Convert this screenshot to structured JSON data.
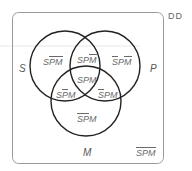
{
  "diagram": {
    "corner_label": "DD",
    "sets": {
      "S": "S",
      "P": "P",
      "M": "M"
    },
    "regions": [
      {
        "id": "s_only",
        "letters": [
          {
            "c": "S",
            "bar": false
          },
          {
            "c": "P",
            "bar": true
          },
          {
            "c": "M",
            "bar": true
          }
        ]
      },
      {
        "id": "sp",
        "letters": [
          {
            "c": "S",
            "bar": false
          },
          {
            "c": "P",
            "bar": false
          },
          {
            "c": "M",
            "bar": true
          }
        ]
      },
      {
        "id": "p_only",
        "letters": [
          {
            "c": "S",
            "bar": true
          },
          {
            "c": "P",
            "bar": false
          },
          {
            "c": "M",
            "bar": true
          }
        ]
      },
      {
        "id": "spm",
        "letters": [
          {
            "c": "S",
            "bar": false
          },
          {
            "c": "P",
            "bar": false
          },
          {
            "c": "M",
            "bar": false
          }
        ]
      },
      {
        "id": "sm",
        "letters": [
          {
            "c": "S",
            "bar": false
          },
          {
            "c": "P",
            "bar": true
          },
          {
            "c": "M",
            "bar": false
          }
        ]
      },
      {
        "id": "pm",
        "letters": [
          {
            "c": "S",
            "bar": true
          },
          {
            "c": "P",
            "bar": false
          },
          {
            "c": "M",
            "bar": false
          }
        ]
      },
      {
        "id": "m_only",
        "letters": [
          {
            "c": "S",
            "bar": true
          },
          {
            "c": "P",
            "bar": true
          },
          {
            "c": "M",
            "bar": false
          }
        ]
      },
      {
        "id": "outside",
        "letters": [
          {
            "c": "S",
            "bar": true
          },
          {
            "c": "P",
            "bar": true
          },
          {
            "c": "M",
            "bar": true
          }
        ]
      }
    ],
    "colors": {
      "circle_stroke": "#222222",
      "box_stroke": "#999999",
      "text": "#6a6a6a"
    }
  }
}
